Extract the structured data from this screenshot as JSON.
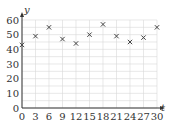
{
  "chart_data": {
    "type": "scatter",
    "title": "",
    "xlabel": "t",
    "ylabel": "y",
    "xlim": [
      0,
      30
    ],
    "ylim": [
      0,
      60
    ],
    "grid": true,
    "marker": "x",
    "x_ticks": [
      0,
      3,
      6,
      9,
      12,
      15,
      18,
      21,
      24,
      27,
      30
    ],
    "y_ticks": [
      0,
      10,
      20,
      30,
      40,
      50,
      60
    ],
    "series": [
      {
        "name": "y",
        "x": [
          0,
          3,
          6,
          9,
          12,
          15,
          18,
          21,
          24,
          27,
          30
        ],
        "values": [
          43,
          49,
          55,
          47,
          44,
          50,
          57,
          49,
          45,
          48,
          55
        ]
      }
    ]
  },
  "colors": {
    "grid": "#d8d8d8",
    "axis": "#333333",
    "marker": "#444444"
  }
}
